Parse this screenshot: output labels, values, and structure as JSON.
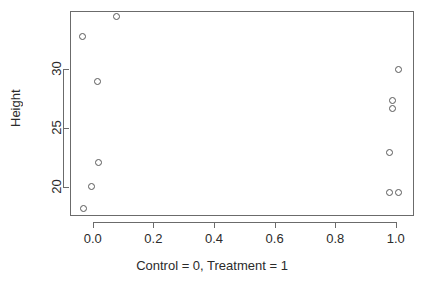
{
  "chart_data": {
    "type": "scatter",
    "title": "",
    "xlabel": "Control = 0, Treatment = 1",
    "ylabel": "Height",
    "xlim": [
      -0.075,
      1.06
    ],
    "ylim": [
      17.5,
      34.9
    ],
    "xticks": [
      "0.0",
      "0.2",
      "0.4",
      "0.6",
      "0.8",
      "1.0"
    ],
    "xtick_values": [
      0.0,
      0.2,
      0.4,
      0.6,
      0.8,
      1.0
    ],
    "yticks": [
      "20",
      "25",
      "30"
    ],
    "ytick_values": [
      20,
      25,
      30
    ],
    "grid": false,
    "legend": "none",
    "point_marker": "open-circle",
    "point_color": "#585858",
    "frame_color": "#6b6b6b",
    "series": [
      {
        "name": "Height by group",
        "points": [
          {
            "x": -0.035,
            "y": 32.7
          },
          {
            "x": 0.08,
            "y": 34.4
          },
          {
            "x": 0.015,
            "y": 28.9
          },
          {
            "x": 0.02,
            "y": 22.0
          },
          {
            "x": -0.005,
            "y": 20.0
          },
          {
            "x": -0.03,
            "y": 18.1
          },
          {
            "x": 1.01,
            "y": 29.9
          },
          {
            "x": 0.99,
            "y": 27.3
          },
          {
            "x": 0.99,
            "y": 26.6
          },
          {
            "x": 0.98,
            "y": 22.9
          },
          {
            "x": 0.978,
            "y": 19.5
          },
          {
            "x": 1.008,
            "y": 19.5
          }
        ]
      }
    ]
  }
}
